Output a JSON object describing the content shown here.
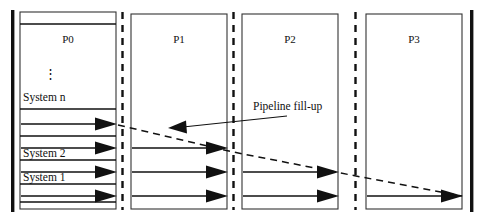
{
  "figure": {
    "kind": "pipeline-timing-diagram",
    "background_color": "#ffffff",
    "ink_color": "#111111",
    "box_border_color": "#333333"
  },
  "stages": [
    {
      "id": "p0",
      "label": "P0",
      "x": 20,
      "y": 12,
      "width": 96,
      "height": 197,
      "arrow_count": 4
    },
    {
      "id": "p1",
      "label": "P1",
      "x": 131,
      "y": 14,
      "width": 96,
      "height": 195,
      "arrow_count": 3
    },
    {
      "id": "p2",
      "label": "P2",
      "x": 242,
      "y": 14,
      "width": 96,
      "height": 195,
      "arrow_count": 2
    },
    {
      "id": "p3",
      "label": "P3",
      "x": 366,
      "y": 14,
      "width": 96,
      "height": 195,
      "arrow_count": 1
    }
  ],
  "stage_labels": {
    "p0": "P0",
    "p1": "P1",
    "p2": "P2",
    "p3": "P3"
  },
  "row_labels": {
    "system_n": "System n",
    "system_2": "System 2",
    "system_1": "System 1",
    "vertical_ellipsis": "⋮"
  },
  "annotation": {
    "text": "Pipeline fill-up",
    "x": 253,
    "y": 110
  },
  "separators": {
    "style": "dashed",
    "x_positions": [
      122,
      232,
      355
    ]
  },
  "boundary_bars": {
    "style": "solid-thick",
    "left_x": 11,
    "right_x": 471,
    "top_y": 10,
    "bottom_y": 212
  },
  "arrow_rows": {
    "y_positions": [
      124,
      148,
      172,
      196
    ]
  },
  "fill_up_polyline": {
    "points": "120,125 232,152 355,175 460,196",
    "style": "dashed"
  }
}
